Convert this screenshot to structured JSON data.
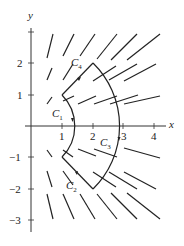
{
  "diagram": {
    "type": "vector field with closed piecewise curve",
    "axes": {
      "x_label": "x",
      "y_label": "y",
      "x_ticks": [
        "1",
        "2",
        "3",
        "4"
      ],
      "y_ticks": [
        "2",
        "1",
        "−1",
        "−2",
        "−3"
      ]
    },
    "curves": [
      {
        "name": "C1",
        "label": "C",
        "sub": "1",
        "description": "arc of radius √2 from (1,1) to (1,−1)"
      },
      {
        "name": "C2",
        "label": "C",
        "sub": "2",
        "description": "segment from (1,−1) to (2,−2)"
      },
      {
        "name": "C3",
        "label": "C",
        "sub": "3",
        "description": "arc of radius 2√2 from (2,−2) to (2,2)"
      },
      {
        "name": "C4",
        "label": "C",
        "sub": "4",
        "description": "segment from (2,2) to (1,1)"
      }
    ]
  }
}
